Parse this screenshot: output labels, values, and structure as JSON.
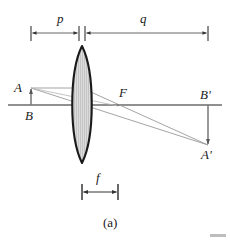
{
  "figure": {
    "caption": "(a)",
    "type": "thin-lens ray diagram",
    "labels": {
      "object_distance": "p",
      "image_distance": "q",
      "focal_length": "f",
      "object_tip": "A",
      "object_base": "B",
      "focal_point": "F",
      "image_base": "B'",
      "image_tip": "A'"
    },
    "colors": {
      "lens_outline": "#1a1a1a",
      "lens_fill": "#d9d9d9",
      "lens_hatch": "#b0b0b0",
      "axis": "#555555",
      "ray": "#8c8c8c",
      "dimension": "#333333",
      "text": "#1a1a1a",
      "background": "#ffffff"
    },
    "geometry": {
      "optical_axis_y": 105,
      "lens_center_x": 82,
      "lens_half_width": 13,
      "lens_top_y": 46,
      "lens_bottom_y": 163,
      "object_x": 31,
      "object_tip_y": 87,
      "focal_point_x": 118,
      "image_x": 208,
      "image_tip_y": 145,
      "dim_top_y": 33,
      "dim_bottom_y": 192
    }
  }
}
